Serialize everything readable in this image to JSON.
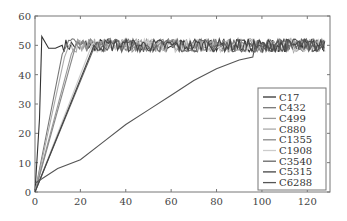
{
  "chart_data": {
    "type": "line",
    "title": "",
    "xlabel": "",
    "ylabel": "",
    "xlim": [
      0,
      130
    ],
    "ylim": [
      0,
      60
    ],
    "xticks": [
      0,
      20,
      40,
      60,
      80,
      100,
      120
    ],
    "yticks": [
      0,
      10,
      20,
      30,
      40,
      50,
      60
    ],
    "grid": false,
    "legend_position": "right-inside",
    "series": [
      {
        "name": "C17",
        "color": "#333333",
        "ramp": [
          [
            0,
            0
          ],
          [
            2,
            25
          ],
          [
            3,
            53
          ],
          [
            6,
            49
          ],
          [
            9,
            49
          ],
          [
            12,
            50
          ]
        ],
        "plateau": 50
      },
      {
        "name": "C432",
        "color": "#777777",
        "ramp": [
          [
            0,
            0
          ],
          [
            12,
            47
          ],
          [
            14,
            50
          ]
        ],
        "plateau": 50
      },
      {
        "name": "C499",
        "color": "#999999",
        "ramp": [
          [
            0,
            0
          ],
          [
            16,
            47
          ],
          [
            18,
            50
          ]
        ],
        "plateau": 50
      },
      {
        "name": "C880",
        "color": "#aaaaaa",
        "ramp": [
          [
            0,
            0
          ],
          [
            13,
            46
          ],
          [
            15,
            50
          ]
        ],
        "plateau": 50
      },
      {
        "name": "C1355",
        "color": "#888888",
        "ramp": [
          [
            0,
            0
          ],
          [
            18,
            50
          ]
        ],
        "plateau": 50
      },
      {
        "name": "C1908",
        "color": "#cccccc",
        "ramp": [
          [
            0,
            0
          ],
          [
            25,
            50
          ]
        ],
        "plateau": 50
      },
      {
        "name": "C3540",
        "color": "#666666",
        "ramp": [
          [
            0,
            0
          ],
          [
            27,
            51
          ]
        ],
        "plateau": 50
      },
      {
        "name": "C5315",
        "color": "#444444",
        "ramp": [
          [
            0,
            0
          ],
          [
            26,
            50
          ]
        ],
        "plateau": 50
      },
      {
        "name": "C6288",
        "color": "#555555",
        "ramp": [
          [
            0,
            3
          ],
          [
            10,
            8
          ],
          [
            20,
            11
          ],
          [
            30,
            17
          ],
          [
            40,
            23
          ],
          [
            50,
            28
          ],
          [
            60,
            33
          ],
          [
            70,
            38
          ],
          [
            80,
            42
          ],
          [
            90,
            45
          ],
          [
            96,
            46
          ],
          [
            97,
            50
          ]
        ],
        "plateau": 50
      }
    ]
  },
  "legend": {
    "items": [
      "C17",
      "C432",
      "C499",
      "C880",
      "C1355",
      "C1908",
      "C3540",
      "C5315",
      "C6288"
    ]
  }
}
